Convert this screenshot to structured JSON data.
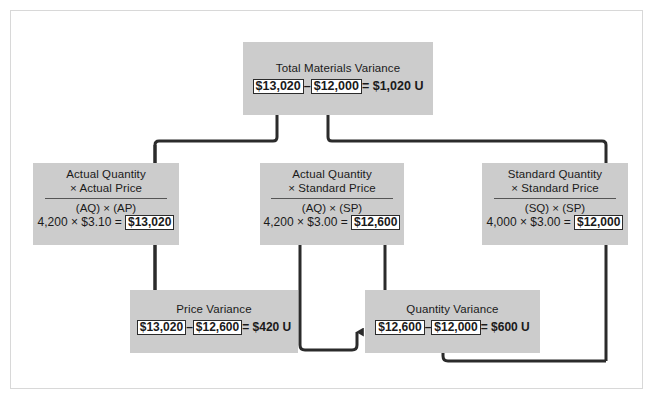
{
  "diagram": {
    "colors": {
      "box_fill": "#cccccc",
      "line": "#2b2b2b",
      "value_box_fill": "#ffffff",
      "frame": "#d8d8d8",
      "background": "#ffffff"
    },
    "total_box": {
      "title": "Total Materials Variance",
      "calc": {
        "left_value": "$13,020",
        "operator": "–",
        "right_value": "$12,000",
        "result": "= $1,020 U"
      }
    },
    "columns": [
      {
        "id": "actual-quantity-actual-price",
        "title_line1": "Actual Quantity",
        "title_line2": "× Actual Price",
        "formula": "(AQ) × (AP)",
        "calc_prefix": "4,200 × $3.10 =",
        "calc_value": "$13,020"
      },
      {
        "id": "actual-quantity-standard-price",
        "title_line1": "Actual Quantity",
        "title_line2": "× Standard Price",
        "formula": "(AQ) × (SP)",
        "calc_prefix": "4,200 × $3.00 =",
        "calc_value": "$12,600"
      },
      {
        "id": "standard-quantity-standard-price",
        "title_line1": "Standard Quantity",
        "title_line2": "× Standard Price",
        "formula": "(SQ) × (SP)",
        "calc_prefix": "4,000 × $3.00 =",
        "calc_value": "$12,000"
      }
    ],
    "variances": [
      {
        "id": "price-variance",
        "title": "Price Variance",
        "left_value": "$13,020",
        "operator": "–",
        "right_value": "$12,600",
        "result": "= $420 U"
      },
      {
        "id": "quantity-variance",
        "title": "Quantity Variance",
        "left_value": "$12,600",
        "operator": "–",
        "right_value": "$12,000",
        "result": "= $600 U"
      }
    ]
  }
}
